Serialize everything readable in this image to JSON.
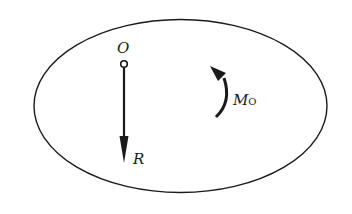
{
  "diagram": {
    "title": "",
    "labels": {
      "origin": "O",
      "resultant": "R",
      "moment_main": "M",
      "moment_sub": "O"
    },
    "colors": {
      "stroke": "#1a1a1a",
      "background": "#ffffff"
    }
  }
}
